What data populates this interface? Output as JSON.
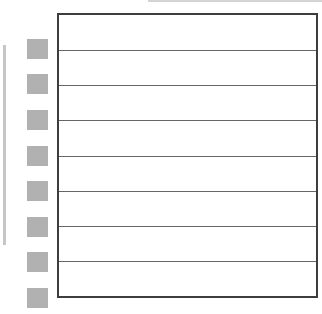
{
  "window": {
    "width": 322,
    "height": 314,
    "background": "#ffffff"
  },
  "top_edge_artifact": {
    "color": "#d4d4d4"
  },
  "left_margin": {
    "edge_bar_color": "#c6c6c6",
    "square_color": "#b1b1b1",
    "squares": [
      {
        "label": ""
      },
      {
        "label": ""
      },
      {
        "label": ""
      },
      {
        "label": ""
      },
      {
        "label": ""
      },
      {
        "label": ""
      },
      {
        "label": ""
      },
      {
        "label": ""
      }
    ]
  },
  "table": {
    "background": "#ffffff",
    "border_color": "#3d3d3d",
    "divider_color": "#666666",
    "rows": [
      "",
      "",
      "",
      "",
      "",
      "",
      "",
      ""
    ]
  }
}
